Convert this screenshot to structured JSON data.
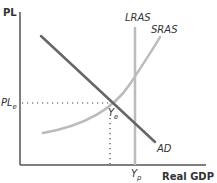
{
  "diagram": {
    "y_axis_label": "PL",
    "x_axis_label": "Real GDP",
    "curves": {
      "ad": {
        "label": "AD",
        "color": "#666666"
      },
      "sras": {
        "label": "SRAS",
        "color": "#bbbbbb"
      },
      "lras": {
        "label": "LRAS",
        "color": "#bbbbbb"
      }
    },
    "equilibrium": {
      "price_label_main": "PL",
      "price_label_sub": "e",
      "output_label_main": "Y",
      "output_label_sub": "e"
    },
    "potential_output": {
      "label_main": "Y",
      "label_sub": "p"
    },
    "colors": {
      "axis": "#555555",
      "guide_dotted": "#444444"
    }
  }
}
